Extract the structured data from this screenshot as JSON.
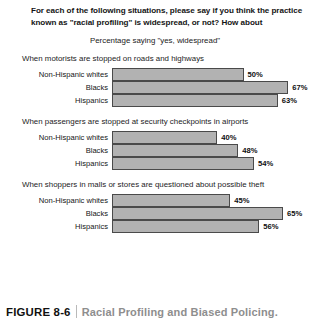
{
  "header": {
    "question_line_1": "For each of the following situations, please say if you think the practice",
    "question_line_2": "known as \"racial profiling\" is widespread, or not? How about",
    "subtitle": "Percentage saying \"yes, widespread\""
  },
  "caption": {
    "number": "FIGURE 8-6",
    "title": "Racial Profiling and Biased Policing."
  },
  "colors": {
    "bar_fill": "#b2b2b2",
    "bar_border": "#4a4a4a",
    "caption_title": "#8e8e8e",
    "caption_number": "#111111"
  },
  "chart_data": {
    "type": "bar",
    "orientation": "horizontal",
    "title": "For each of the following situations, please say if you think the practice known as \"racial profiling\" is widespread, or not? How about",
    "subtitle": "Percentage saying \"yes, widespread\"",
    "xlabel": "",
    "ylabel": "",
    "xlim": [
      0,
      100
    ],
    "grid": false,
    "legend": false,
    "value_suffix": "%",
    "categories": [
      "Non-Hispanic whites",
      "Blacks",
      "Hispanics"
    ],
    "groups": [
      {
        "heading": "When motorists are stopped on roads and highways",
        "bars": [
          {
            "label": "Non-Hispanic whites",
            "value": 50,
            "value_label": "50%"
          },
          {
            "label": "Blacks",
            "value": 67,
            "value_label": "67%"
          },
          {
            "label": "Hispanics",
            "value": 63,
            "value_label": "63%"
          }
        ]
      },
      {
        "heading": "When passengers are stopped at security checkpoints in airports",
        "bars": [
          {
            "label": "Non-Hispanic whites",
            "value": 40,
            "value_label": "40%"
          },
          {
            "label": "Blacks",
            "value": 48,
            "value_label": "48%"
          },
          {
            "label": "Hispanics",
            "value": 54,
            "value_label": "54%"
          }
        ]
      },
      {
        "heading": "When shoppers in malls or stores are questioned about possible theft",
        "bars": [
          {
            "label": "Non-Hispanic whites",
            "value": 45,
            "value_label": "45%"
          },
          {
            "label": "Blacks",
            "value": 65,
            "value_label": "65%"
          },
          {
            "label": "Hispanics",
            "value": 56,
            "value_label": "56%"
          }
        ]
      }
    ]
  }
}
